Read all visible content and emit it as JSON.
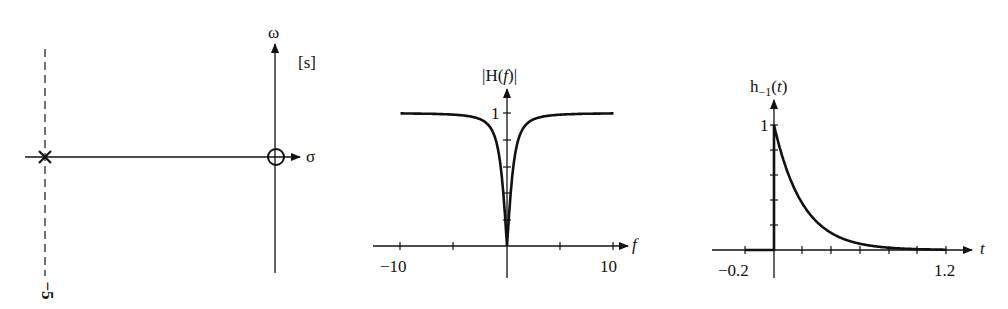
{
  "panels": {
    "s_plane": {
      "plane_label": "[s]",
      "imag_axis_label": "ω",
      "real_axis_label": "σ",
      "pole_marker": "×",
      "pole_location": -5,
      "pole_tick_label": "−5",
      "zero_location": 0
    },
    "magnitude": {
      "ylabel": "|H(f)|",
      "xlabel": "f",
      "ytick": "1",
      "xtick_left": "−10",
      "xtick_right": "10"
    },
    "step_response": {
      "ylabel_main": "h",
      "ylabel_sub": "−1",
      "ylabel_arg": "(t)",
      "xlabel": "t",
      "ytick": "1",
      "xtick_left": "−0.2",
      "xtick_right": "1.2"
    }
  },
  "chart_data": [
    {
      "type": "scatter",
      "title": "Pole-zero plot in s-plane",
      "xlabel": "σ",
      "ylabel": "ω",
      "annotations": [
        "[s]"
      ],
      "poles": [
        {
          "sigma": -5,
          "omega": 0
        }
      ],
      "zeros": [
        {
          "sigma": 0,
          "omega": 0
        }
      ]
    },
    {
      "type": "line",
      "title": "Magnitude response",
      "xlabel": "f",
      "ylabel": "|H(f)|",
      "xlim": [
        -10,
        10
      ],
      "ylim": [
        0,
        1.1
      ],
      "x": [
        -10,
        -8,
        -6,
        -4,
        -3,
        -2,
        -1.5,
        -1,
        -0.5,
        -0.25,
        0,
        0.25,
        0.5,
        1,
        1.5,
        2,
        3,
        4,
        6,
        8,
        10
      ],
      "values": [
        0.988,
        0.981,
        0.967,
        0.929,
        0.883,
        0.783,
        0.686,
        0.532,
        0.3,
        0.155,
        0,
        0.155,
        0.3,
        0.532,
        0.686,
        0.783,
        0.883,
        0.929,
        0.967,
        0.981,
        0.988
      ]
    },
    {
      "type": "line",
      "title": "Step response",
      "xlabel": "t",
      "ylabel": "h_-1(t)",
      "xlim": [
        -0.2,
        1.2
      ],
      "ylim": [
        0,
        1.1
      ],
      "x": [
        -0.2,
        0,
        0.1,
        0.2,
        0.3,
        0.4,
        0.5,
        0.6,
        0.8,
        1.0,
        1.2
      ],
      "values": [
        0,
        1,
        0.607,
        0.368,
        0.223,
        0.135,
        0.082,
        0.05,
        0.018,
        0.007,
        0.002
      ]
    }
  ]
}
